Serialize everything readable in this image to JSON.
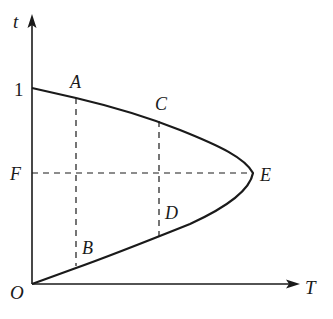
{
  "diagram": {
    "type": "t-T graph (parabola-shaped curve)",
    "axes": {
      "vertical_label": "t",
      "horizontal_label": "T",
      "origin_label": "O",
      "vertical_tick_label": "1"
    },
    "points": [
      {
        "id": "A",
        "label": "A"
      },
      {
        "id": "B",
        "label": "B"
      },
      {
        "id": "C",
        "label": "C"
      },
      {
        "id": "D",
        "label": "D"
      },
      {
        "id": "E",
        "label": "E"
      },
      {
        "id": "F",
        "label": "F"
      }
    ],
    "dashed_lines": [
      {
        "from": "A",
        "to": "B"
      },
      {
        "from": "C",
        "to": "D"
      },
      {
        "from": "F",
        "to": "E"
      }
    ],
    "colors": {
      "stroke": "#1a1a1a",
      "background": "#ffffff"
    }
  }
}
